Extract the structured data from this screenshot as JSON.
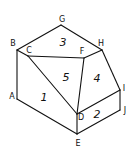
{
  "diagram": {
    "type": "isometric-solid-face-labels",
    "vertices": {
      "A": {
        "label": "A",
        "x": 17,
        "y": 99,
        "lx": 12,
        "ly": 99
      },
      "B": {
        "label": "B",
        "x": 17,
        "y": 50,
        "lx": 13,
        "ly": 46
      },
      "C": {
        "label": "C",
        "x": 28,
        "y": 56,
        "lx": 29,
        "ly": 53
      },
      "D": {
        "label": "D",
        "x": 77,
        "y": 114,
        "lx": 81,
        "ly": 120
      },
      "E": {
        "label": "E",
        "x": 77,
        "y": 134,
        "lx": 78,
        "ly": 146
      },
      "F": {
        "label": "F",
        "x": 84,
        "y": 58,
        "lx": 82,
        "ly": 54
      },
      "G": {
        "label": "G",
        "x": 61,
        "y": 25,
        "lx": 62,
        "ly": 22
      },
      "H": {
        "label": "H",
        "x": 102,
        "y": 50,
        "lx": 101,
        "ly": 46
      },
      "I": {
        "label": "I",
        "x": 120,
        "y": 90,
        "lx": 124,
        "ly": 91
      },
      "J": {
        "label": "J",
        "x": 120,
        "y": 110,
        "lx": 125,
        "ly": 113
      }
    },
    "faces": [
      {
        "label": "1",
        "x": 44,
        "y": 101
      },
      {
        "label": "2",
        "x": 97,
        "y": 118
      },
      {
        "label": "3",
        "x": 63,
        "y": 46
      },
      {
        "label": "4",
        "x": 97,
        "y": 82
      },
      {
        "label": "5",
        "x": 66,
        "y": 81
      }
    ],
    "edges": [
      [
        "B",
        "G"
      ],
      [
        "G",
        "H"
      ],
      [
        "B",
        "C"
      ],
      [
        "C",
        "F"
      ],
      [
        "F",
        "H"
      ],
      [
        "B",
        "A"
      ],
      [
        "A",
        "E"
      ],
      [
        "C",
        "D"
      ],
      [
        "F",
        "D"
      ],
      [
        "H",
        "I"
      ],
      [
        "I",
        "D"
      ],
      [
        "I",
        "J"
      ],
      [
        "J",
        "E"
      ],
      [
        "D",
        "E"
      ]
    ]
  }
}
